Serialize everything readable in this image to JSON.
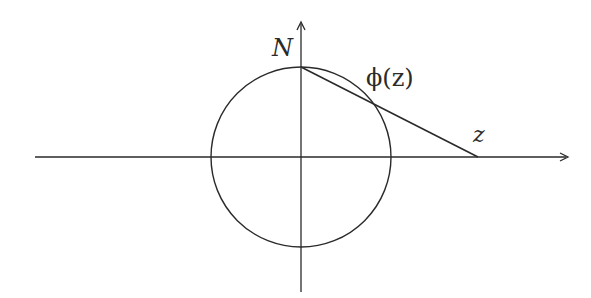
{
  "diagram": {
    "labels": {
      "north_pole": "N",
      "projection": "ϕ(z)",
      "point": "z"
    },
    "geometry": {
      "center": [
        301,
        157
      ],
      "radius": 90,
      "north_pole": [
        301,
        67
      ],
      "point_z": [
        478,
        157
      ],
      "intersection": [
        374,
        104
      ],
      "x_axis": {
        "from": [
          35,
          157
        ],
        "to": [
          568,
          157
        ]
      },
      "y_axis": {
        "from": [
          301,
          292
        ],
        "to": [
          301,
          22
        ]
      }
    },
    "colors": {
      "stroke": "#2a2a2a",
      "background": "#ffffff"
    }
  }
}
